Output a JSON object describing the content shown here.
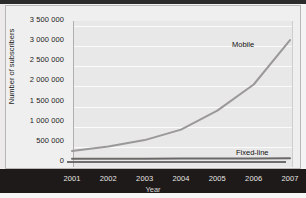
{
  "figure": {
    "background_color": "#f0efef",
    "plot_background_color": "#e9e8e8",
    "gridline_color": "#fbfbfb",
    "axis_color": "#6e6c6c",
    "series_color_mobile": "#9a9898",
    "series_color_fixed": "#6b6968"
  },
  "chart_data": {
    "type": "line",
    "title": "",
    "xlabel": "Year",
    "ylabel": "Number of subscribers",
    "x": [
      "2001",
      "2002",
      "2003",
      "2004",
      "2005",
      "2006",
      "2007"
    ],
    "xtick_labels": [
      "2001",
      "2002",
      "2003",
      "2004",
      "2005",
      "2006",
      "2007"
    ],
    "ytick_labels": [
      "0",
      "500 000",
      "1 000 000",
      "1 500 000",
      "2 000 000",
      "2 500 000",
      "3 000 000",
      "3 500 000"
    ],
    "ytick_values": [
      0,
      500000,
      1000000,
      1500000,
      2000000,
      2500000,
      3000000,
      3500000
    ],
    "ylim": [
      0,
      3500000
    ],
    "xlim": [
      "2001",
      "2007"
    ],
    "grid": true,
    "legend_position": "inline-annotations",
    "series": [
      {
        "name": "Mobile",
        "values": [
          250000,
          360000,
          520000,
          780000,
          1250000,
          1900000,
          3000000
        ]
      },
      {
        "name": "Fixed-line",
        "values": [
          55000,
          57000,
          58000,
          60000,
          62000,
          64000,
          66000
        ]
      }
    ],
    "annotations": [
      {
        "text": "Mobile",
        "series": "Mobile"
      },
      {
        "text": "Fixed-line",
        "series": "Fixed-line"
      }
    ]
  }
}
